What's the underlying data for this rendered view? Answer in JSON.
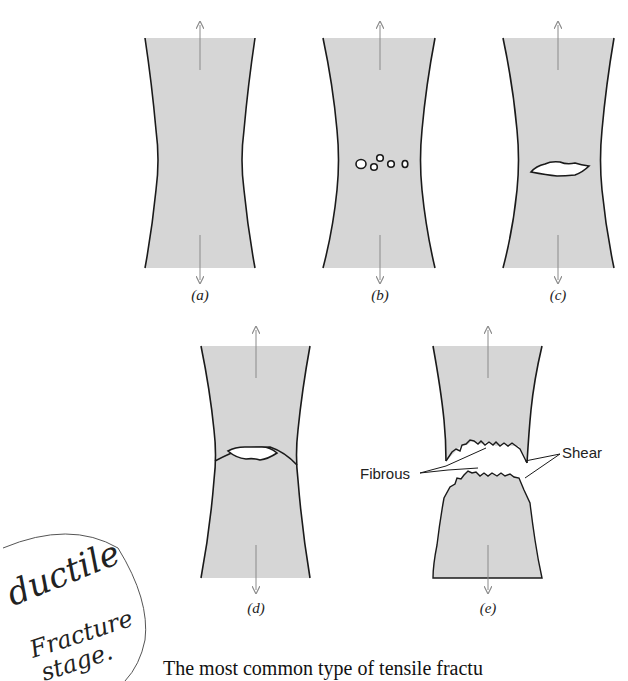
{
  "figure": {
    "panels": [
      {
        "id": "a",
        "caption": "(a)",
        "stage": "necking"
      },
      {
        "id": "b",
        "caption": "(b)",
        "stage": "small cavity formation"
      },
      {
        "id": "c",
        "caption": "(c)",
        "stage": "coalescence of cavities to form a crack"
      },
      {
        "id": "d",
        "caption": "(d)",
        "stage": "crack propagation"
      },
      {
        "id": "e",
        "caption": "(e)",
        "stage": "final shear fracture"
      }
    ],
    "labels": {
      "fibrous": "Fibrous",
      "shear": "Shear"
    },
    "colors": {
      "specimen_fill": "#d6d6d6",
      "outline": "#1a1a1a",
      "arrow": "#8a8a8a"
    }
  },
  "annotation": {
    "line1": "ductile",
    "line2": "Fracture",
    "line3": "stage."
  },
  "body_text": "The most common type of tensile fractu"
}
